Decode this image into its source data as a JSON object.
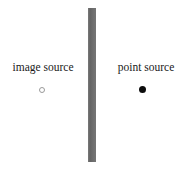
{
  "figure": {
    "width": 186,
    "height": 172,
    "background_color": "#ffffff",
    "caption": ""
  },
  "wall": {
    "name": "reflecting-wall",
    "color": "#6a6a6a",
    "orientation": "vertical"
  },
  "left_group": {
    "label": "image source",
    "marker_style": "hollow-circle",
    "marker_color": "#9a9a9a"
  },
  "right_group": {
    "label": "point source",
    "marker_style": "filled-circle",
    "marker_color": "#0d0d0d"
  }
}
